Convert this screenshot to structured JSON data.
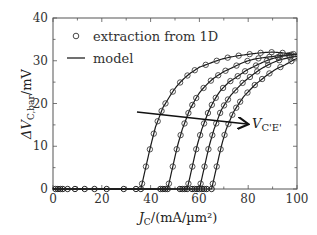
{
  "chart_data": {
    "type": "line",
    "title": "",
    "xlabel": "J_C/(mA/µm²)",
    "ylabel": "ΔV_C,bar/mV",
    "xlim": [
      0,
      100
    ],
    "ylim": [
      0,
      40
    ],
    "xticks": [
      0,
      20,
      40,
      60,
      80,
      100
    ],
    "yticks": [
      0,
      10,
      20,
      30,
      40
    ],
    "grid": false,
    "legend": {
      "position": "upper-left",
      "entries": [
        {
          "label": "extraction from 1D",
          "marker": "circle"
        },
        {
          "label": "model",
          "marker": "line"
        }
      ]
    },
    "annotation": {
      "text": "V_C'E'",
      "arrow_from": [
        34,
        17.8
      ],
      "arrow_to": [
        79,
        15.0
      ],
      "meaning": "increasing V_C'E' across curves"
    },
    "series": [
      {
        "name": "curve-1",
        "x": [
          0,
          36,
          38,
          40,
          42,
          45,
          50,
          55,
          60,
          70,
          80,
          90,
          100
        ],
        "y": [
          0,
          0,
          5,
          10,
          14.5,
          19,
          23.5,
          26.5,
          28.5,
          30.5,
          31.5,
          32,
          31.5
        ]
      },
      {
        "name": "curve-2",
        "x": [
          0,
          47,
          49,
          51,
          53,
          56,
          60,
          65,
          70,
          80,
          90,
          100
        ],
        "y": [
          0,
          0,
          5,
          10,
          14,
          18.5,
          22.5,
          25.5,
          27.5,
          30,
          31,
          31.5
        ]
      },
      {
        "name": "curve-3",
        "x": [
          0,
          55,
          57,
          59,
          61,
          64,
          68,
          72,
          80,
          90,
          100
        ],
        "y": [
          0,
          0,
          5,
          10,
          14,
          18.5,
          22.5,
          25,
          28,
          30.5,
          31.5
        ]
      },
      {
        "name": "curve-4",
        "x": [
          0,
          60,
          62,
          64,
          66,
          69,
          73,
          78,
          85,
          92,
          100
        ],
        "y": [
          0,
          0,
          5,
          10,
          14,
          18.5,
          22,
          25,
          28,
          30,
          31
        ]
      },
      {
        "name": "curve-5",
        "x": [
          0,
          65,
          67,
          69,
          71,
          74,
          78,
          83,
          90,
          95,
          100
        ],
        "y": [
          0,
          0,
          5,
          10,
          14,
          18,
          21.5,
          24.5,
          27.5,
          29,
          30.5
        ]
      }
    ],
    "zero_markers_x": [
      1,
      2,
      3,
      4,
      6,
      9,
      13,
      17,
      22,
      29,
      34,
      36,
      44,
      45,
      46,
      47,
      52,
      53,
      54,
      55,
      57,
      58,
      59,
      60,
      61,
      62,
      63,
      65
    ]
  },
  "labels": {
    "y_axis": "ΔV",
    "y_axis_sub": "C,bar",
    "y_axis_unit": "/mV",
    "x_axis": "J",
    "x_axis_sub": "C",
    "x_axis_unit": "/(mA/µm²)",
    "legend_1": "extraction from 1D",
    "legend_2": "model",
    "annotation": "V",
    "annotation_sub": "C'E'",
    "xtick_0": "0",
    "xtick_20": "20",
    "xtick_40": "40",
    "xtick_60": "60",
    "xtick_80": "80",
    "xtick_100": "100",
    "ytick_0": "0",
    "ytick_10": "10",
    "ytick_20": "20",
    "ytick_30": "30",
    "ytick_40": "40"
  }
}
